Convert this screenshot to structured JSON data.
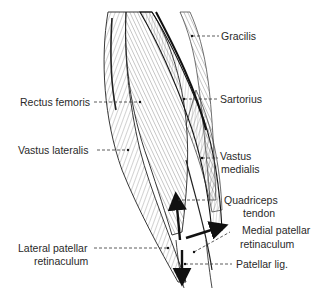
{
  "figure": {
    "labels": {
      "gracilis": "Gracilis",
      "sartorius": "Sartorius",
      "rectus_femoris": "Rectus femoris",
      "vastus_lateralis": "Vastus lateralis",
      "vastus_medialis_line1": "Vastus",
      "vastus_medialis_line2": "medialis",
      "quadriceps_tendon_line1": "Quadriceps",
      "quadriceps_tendon_line2": "tendon",
      "medial_patellar_retinaculum_line1": "Medial patellar",
      "medial_patellar_retinaculum_line2": "retinaculum",
      "lateral_patellar_retinaculum_line1": "Lateral patellar",
      "lateral_patellar_retinaculum_line2": "retinaculum",
      "patellar_lig": "Patellar lig."
    },
    "arrows": [
      "upward-force-arrow",
      "downward-force-arrow",
      "medial-force-arrow"
    ],
    "colors": {
      "ink": "#1a1a1a",
      "hatch": "#555555",
      "background": "#ffffff"
    }
  }
}
